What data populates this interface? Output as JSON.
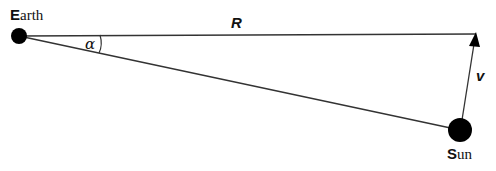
{
  "diagram": {
    "earth": {
      "initial": "E",
      "rest": "arth"
    },
    "sun": {
      "initial": "S",
      "rest": "un"
    },
    "distance_label": "R",
    "velocity_label": "v",
    "angle_label": "α",
    "colors": {
      "line": "#333333",
      "body": "#000000",
      "background": "#ffffff"
    }
  }
}
